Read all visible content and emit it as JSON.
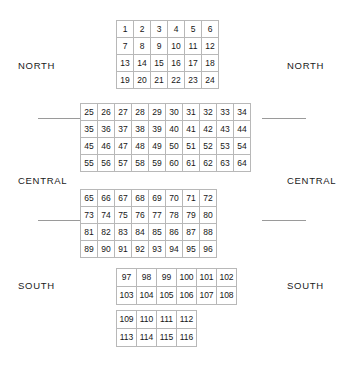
{
  "regions": {
    "left": [
      {
        "name": "north",
        "label": "NORTH"
      },
      {
        "name": "central",
        "label": "CENTRAL"
      },
      {
        "name": "south",
        "label": "SOUTH"
      }
    ],
    "right": [
      {
        "name": "north",
        "label": "NORTH"
      },
      {
        "name": "central",
        "label": "CENTRAL"
      },
      {
        "name": "south",
        "label": "SOUTH"
      }
    ]
  },
  "dividers": [
    {
      "name": "north-central-left",
      "side": "left",
      "x": 38,
      "y": 118,
      "width": 44
    },
    {
      "name": "north-central-right",
      "side": "right",
      "x": 262,
      "y": 118,
      "width": 44
    },
    {
      "name": "central-south-left",
      "side": "left",
      "x": 38,
      "y": 220,
      "width": 44
    },
    {
      "name": "central-south-right",
      "side": "right",
      "x": 262,
      "y": 220,
      "width": 44
    }
  ],
  "grid": {
    "cell_size_main": 18,
    "cell_size_lower": 21,
    "bands": [
      {
        "name": "band-north",
        "left": 116,
        "top": 20,
        "cell_class": "w18",
        "rows": [
          [
            1,
            2,
            3,
            4,
            5,
            6
          ],
          [
            7,
            8,
            9,
            10,
            11,
            12
          ],
          [
            13,
            14,
            15,
            16,
            17,
            18
          ],
          [
            19,
            20,
            21,
            22,
            23,
            24
          ]
        ]
      },
      {
        "name": "band-central-wide",
        "left": 80,
        "top": 103,
        "cell_class": "w18",
        "rows": [
          [
            25,
            26,
            27,
            28,
            29,
            30,
            31,
            32,
            33,
            34
          ],
          [
            35,
            36,
            37,
            38,
            39,
            40,
            41,
            42,
            43,
            44
          ],
          [
            45,
            46,
            47,
            48,
            49,
            50,
            51,
            52,
            53,
            54
          ],
          [
            55,
            56,
            57,
            58,
            59,
            60,
            61,
            62,
            63,
            64
          ]
        ]
      },
      {
        "name": "band-central-narrow",
        "left": 80,
        "top": 189,
        "cell_class": "w18",
        "rows": [
          [
            65,
            66,
            67,
            68,
            69,
            70,
            71,
            72
          ],
          [
            73,
            74,
            75,
            76,
            77,
            78,
            79,
            80
          ],
          [
            81,
            82,
            83,
            84,
            85,
            86,
            87,
            88
          ],
          [
            89,
            90,
            91,
            92,
            93,
            94,
            95,
            96
          ]
        ]
      },
      {
        "name": "band-south-wide",
        "left": 116,
        "top": 268,
        "cell_class": "w21",
        "rows": [
          [
            97,
            98,
            99,
            100,
            101,
            102
          ],
          [
            103,
            104,
            105,
            106,
            107,
            108
          ]
        ]
      },
      {
        "name": "band-south-narrow",
        "left": 116,
        "top": 310,
        "cell_class": "w21",
        "rows": [
          [
            109,
            110,
            111,
            112
          ],
          [
            113,
            114,
            115,
            116
          ]
        ]
      }
    ]
  },
  "label_positions": {
    "left": [
      {
        "x": 18,
        "y": 61
      },
      {
        "x": 18,
        "y": 176
      },
      {
        "x": 18,
        "y": 281
      }
    ],
    "right": [
      {
        "x": 287,
        "y": 61
      },
      {
        "x": 287,
        "y": 176
      },
      {
        "x": 287,
        "y": 281
      }
    ]
  }
}
